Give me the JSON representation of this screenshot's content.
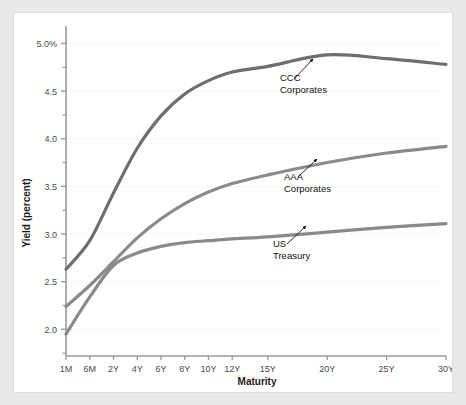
{
  "card": {
    "title": ""
  },
  "chart_data": {
    "type": "line",
    "title": "",
    "xlabel": "Maturity",
    "ylabel": "Yield (percent)",
    "categories": [
      "1M",
      "6M",
      "2Y",
      "4Y",
      "6Y",
      "8Y",
      "10Y",
      "12Y",
      "15Y",
      "20Y",
      "25Y",
      "30Y"
    ],
    "x_positions": [
      0,
      1,
      2,
      3,
      4,
      5,
      6,
      7,
      8.5,
      11,
      13.5,
      16
    ],
    "xtick_labels": [
      "1M",
      "6M",
      "2Y",
      "4Y",
      "6Y",
      "8Y",
      "10Y",
      "12Y",
      "15Y",
      "20Y",
      "25Y",
      "30Y"
    ],
    "ytick_labels": [
      "5.0%",
      "4.5",
      "4.0",
      "3.5",
      "3.0",
      "2.5",
      "2.0"
    ],
    "ytick_values": [
      5.0,
      4.5,
      4.0,
      3.5,
      3.0,
      2.5,
      2.0
    ],
    "yminor_values": [
      4.75,
      4.25,
      3.75,
      3.25,
      2.75,
      2.25,
      1.75
    ],
    "ylim": [
      1.72,
      5.12
    ],
    "grid": true,
    "legend_position": "inline-annotations",
    "series": [
      {
        "name": "CCC Corporates",
        "color": "#6e6e6e",
        "values": [
          2.63,
          2.93,
          3.43,
          3.9,
          4.24,
          4.47,
          4.61,
          4.7,
          4.76,
          4.88,
          4.84,
          4.78
        ]
      },
      {
        "name": "AAA Corporates",
        "color": "#8a8a8a",
        "values": [
          2.24,
          2.46,
          2.71,
          2.96,
          3.16,
          3.32,
          3.44,
          3.53,
          3.62,
          3.75,
          3.85,
          3.92
        ]
      },
      {
        "name": "US Treasury",
        "color": "#8a8a8a",
        "values": [
          1.95,
          2.34,
          2.67,
          2.8,
          2.87,
          2.91,
          2.93,
          2.95,
          2.97,
          3.02,
          3.07,
          3.11
        ]
      }
    ],
    "annotations": [
      {
        "label_line1": "CCC",
        "label_line2": "Corporates",
        "text_x": 318,
        "text_y": 62,
        "arrow_from_x": 318,
        "arrow_from_y": 66,
        "arrow_to_x": 337,
        "arrow_to_y": 46
      },
      {
        "label_line1": "AAA",
        "label_line2": "Corporates",
        "text_x": 322,
        "text_y": 161,
        "arrow_from_x": 322,
        "arrow_from_y": 164,
        "arrow_to_x": 341,
        "arrow_to_y": 146
      },
      {
        "label_line1": "US",
        "label_line2": "Treasury",
        "text_x": 311,
        "text_y": 228,
        "arrow_from_x": 311,
        "arrow_from_y": 231,
        "arrow_to_x": 330,
        "arrow_to_y": 213
      }
    ]
  }
}
